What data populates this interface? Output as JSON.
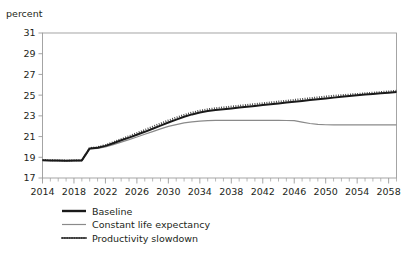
{
  "chart_data": {
    "type": "line",
    "title": "",
    "subtitle": "",
    "ylabel": "percent",
    "xlabel": "",
    "grid": false,
    "legend_position": "bottom-left",
    "xlim": [
      2014,
      2059
    ],
    "ylim": [
      17,
      31
    ],
    "ytick_values": [
      17,
      19,
      21,
      23,
      25,
      27,
      29,
      31
    ],
    "ytick_labels": [
      "17",
      "19",
      "21",
      "23",
      "25",
      "27",
      "29",
      "31"
    ],
    "xtick_values": [
      2014,
      2018,
      2022,
      2026,
      2030,
      2034,
      2038,
      2042,
      2046,
      2050,
      2054,
      2058
    ],
    "xtick_labels": [
      "2014",
      "2018",
      "2022",
      "2026",
      "2030",
      "2034",
      "2038",
      "2042",
      "2046",
      "2050",
      "2054",
      "2058"
    ],
    "xminor_step": 1,
    "x": [
      2014,
      2015,
      2016,
      2017,
      2018,
      2019,
      2020,
      2021,
      2022,
      2023,
      2024,
      2025,
      2026,
      2027,
      2028,
      2029,
      2030,
      2031,
      2032,
      2033,
      2034,
      2035,
      2036,
      2037,
      2038,
      2039,
      2040,
      2041,
      2042,
      2043,
      2044,
      2045,
      2046,
      2047,
      2048,
      2049,
      2050,
      2051,
      2052,
      2053,
      2054,
      2055,
      2056,
      2057,
      2058,
      2059
    ],
    "series": [
      {
        "name": "Baseline",
        "style": "solid-thick",
        "color": "#1a1a1a",
        "width": 2.0,
        "values": [
          18.72,
          18.7,
          18.68,
          18.66,
          18.68,
          18.7,
          19.86,
          19.92,
          20.1,
          20.36,
          20.64,
          20.9,
          21.18,
          21.46,
          21.76,
          22.06,
          22.36,
          22.64,
          22.92,
          23.14,
          23.32,
          23.46,
          23.56,
          23.64,
          23.72,
          23.8,
          23.88,
          23.96,
          24.04,
          24.12,
          24.2,
          24.28,
          24.36,
          24.44,
          24.52,
          24.6,
          24.68,
          24.76,
          24.84,
          24.92,
          25.0,
          25.06,
          25.12,
          25.18,
          25.24,
          25.3
        ]
      },
      {
        "name": "Constant life expectancy",
        "style": "solid-thin",
        "color": "#8a8a8a",
        "width": 1.2,
        "values": [
          18.7,
          18.68,
          18.66,
          18.64,
          18.66,
          18.68,
          19.82,
          19.86,
          20.0,
          20.22,
          20.46,
          20.7,
          20.96,
          21.22,
          21.48,
          21.74,
          21.98,
          22.16,
          22.32,
          22.42,
          22.5,
          22.54,
          22.56,
          22.56,
          22.56,
          22.56,
          22.56,
          22.56,
          22.56,
          22.56,
          22.56,
          22.55,
          22.54,
          22.4,
          22.26,
          22.18,
          22.14,
          22.13,
          22.12,
          22.12,
          22.12,
          22.12,
          22.12,
          22.12,
          22.12,
          22.12
        ]
      },
      {
        "name": "Productivity slowdown",
        "style": "dotted",
        "color": "#3a3a3a",
        "width": 1.9,
        "values": [
          18.74,
          18.72,
          18.7,
          18.68,
          18.7,
          18.72,
          19.9,
          19.98,
          20.18,
          20.46,
          20.76,
          21.04,
          21.34,
          21.64,
          21.96,
          22.26,
          22.56,
          22.84,
          23.1,
          23.32,
          23.5,
          23.64,
          23.74,
          23.82,
          23.9,
          23.98,
          24.06,
          24.14,
          24.22,
          24.3,
          24.38,
          24.46,
          24.54,
          24.62,
          24.7,
          24.78,
          24.86,
          24.94,
          25.0,
          25.06,
          25.12,
          25.18,
          25.24,
          25.3,
          25.36,
          25.42
        ]
      }
    ]
  },
  "legend": {
    "items": [
      {
        "label": "Baseline"
      },
      {
        "label": "Constant life expectancy"
      },
      {
        "label": "Productivity slowdown"
      }
    ]
  }
}
